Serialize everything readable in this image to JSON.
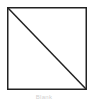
{
  "figure": {
    "shape": "square-with-diagonal",
    "stroke_color": "#222222",
    "fill_color": "#ffffff",
    "caption": "Blank"
  }
}
